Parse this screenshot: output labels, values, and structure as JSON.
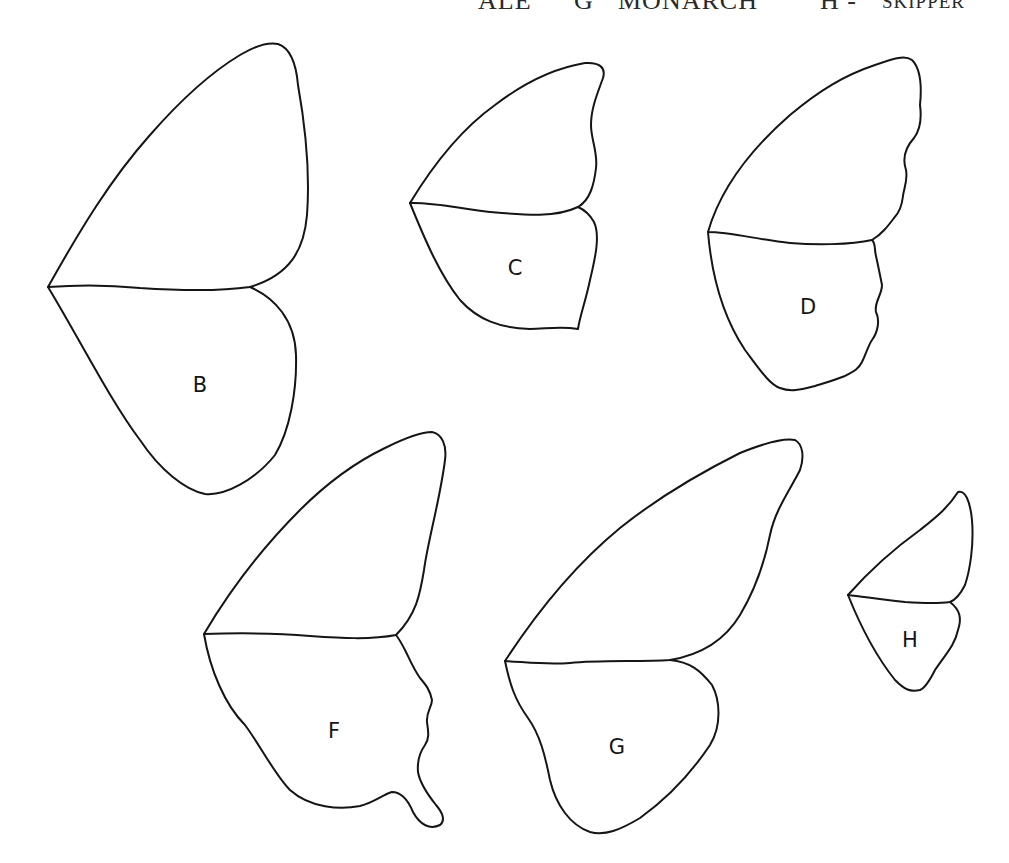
{
  "caption": {
    "fragments": [
      {
        "text": "ALE",
        "note": "clipped"
      },
      {
        "text": "G"
      },
      {
        "text": "MONARCH"
      },
      {
        "text": "H - "
      },
      {
        "text": "SKIPPER"
      }
    ]
  },
  "wings": [
    {
      "id": "B",
      "label": "B"
    },
    {
      "id": "C",
      "label": "C"
    },
    {
      "id": "D",
      "label": "D"
    },
    {
      "id": "F",
      "label": "F"
    },
    {
      "id": "G",
      "label": "G"
    },
    {
      "id": "H",
      "label": "H"
    }
  ],
  "colors": {
    "background": "#ffffff",
    "line": "#151515",
    "caption": "#2a2a2a"
  }
}
